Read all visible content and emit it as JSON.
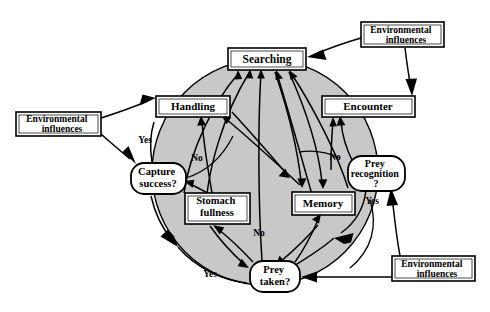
{
  "diagram": {
    "type": "flowchart",
    "background_color": "#ffffff",
    "arena": {
      "name": "foraging-arena-circle",
      "fill_color": "#c8c8c8",
      "stroke_color": "#000000",
      "cx": 265,
      "cy": 172,
      "r": 113
    },
    "nodes": [
      {
        "id": "searching",
        "label": "Searching",
        "shape": "rect",
        "x": 228,
        "y": 48,
        "w": 78,
        "h": 22
      },
      {
        "id": "handling",
        "label": "Handling",
        "shape": "rect",
        "x": 156,
        "y": 96,
        "w": 74,
        "h": 21
      },
      {
        "id": "encounter",
        "label": "Encounter",
        "shape": "rect",
        "x": 322,
        "y": 96,
        "w": 93,
        "h": 21
      },
      {
        "id": "memory",
        "label": "Memory",
        "shape": "rect",
        "x": 292,
        "y": 192,
        "w": 63,
        "h": 23
      },
      {
        "id": "stomach",
        "label": "Stomach\nfullness",
        "shape": "rect",
        "x": 185,
        "y": 193,
        "w": 65,
        "h": 31
      },
      {
        "id": "env_left",
        "label": "Environmental\ninfluences",
        "shape": "rect",
        "x": 16,
        "y": 112,
        "w": 85,
        "h": 24
      },
      {
        "id": "env_topright",
        "label": "Environmental\ninfluences",
        "shape": "rect",
        "x": 361,
        "y": 22,
        "w": 83,
        "h": 25
      },
      {
        "id": "env_botright",
        "label": "Environmental\ninfluences",
        "shape": "rect",
        "x": 392,
        "y": 256,
        "w": 83,
        "h": 25
      },
      {
        "id": "capture",
        "label": "Capture\nsuccess?",
        "shape": "round",
        "x": 131,
        "y": 163,
        "w": 55,
        "h": 31
      },
      {
        "id": "recognition",
        "label": "Prey\nrecognition\n?",
        "shape": "round",
        "x": 348,
        "y": 156,
        "w": 57,
        "h": 35
      },
      {
        "id": "preytaken",
        "label": "Prey\ntaken?",
        "shape": "round",
        "x": 250,
        "y": 261,
        "w": 50,
        "h": 31
      }
    ],
    "edge_labels": [
      {
        "id": "yes_capture",
        "text": "Yes",
        "x": 145,
        "y": 143
      },
      {
        "id": "no_capture",
        "text": "No",
        "x": 197,
        "y": 161
      },
      {
        "id": "no_recognition",
        "text": "No",
        "x": 335,
        "y": 160
      },
      {
        "id": "yes_recognition",
        "text": "Yes",
        "x": 372,
        "y": 204
      },
      {
        "id": "no_preytaken",
        "text": "No",
        "x": 259,
        "y": 236
      },
      {
        "id": "yes_preytaken",
        "text": "Yes",
        "x": 210,
        "y": 277
      }
    ]
  }
}
